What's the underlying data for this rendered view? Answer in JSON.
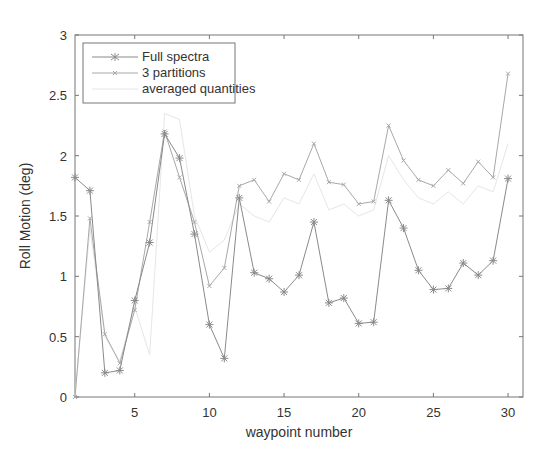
{
  "chart_data": {
    "type": "line",
    "title": "",
    "xlabel": "waypoint number",
    "ylabel": "Roll Motion (deg)",
    "xlim": [
      1,
      31
    ],
    "ylim": [
      0,
      3
    ],
    "xticks": [
      5,
      10,
      15,
      20,
      25,
      30
    ],
    "yticks": [
      0,
      0.5,
      1,
      1.5,
      2,
      2.5,
      3
    ],
    "grid": false,
    "legend_position": "upper left",
    "x": [
      1,
      2,
      3,
      4,
      5,
      6,
      7,
      8,
      9,
      10,
      11,
      12,
      13,
      14,
      15,
      16,
      17,
      18,
      19,
      20,
      21,
      22,
      23,
      24,
      25,
      26,
      27,
      28,
      29,
      30
    ],
    "series": [
      {
        "name": "Full spectra",
        "marker": "*",
        "color": "#8a8a8a",
        "values": [
          1.82,
          1.71,
          0.2,
          0.22,
          0.8,
          1.28,
          2.18,
          1.98,
          1.35,
          0.6,
          0.32,
          1.65,
          1.03,
          0.98,
          0.87,
          1.01,
          1.45,
          0.78,
          0.82,
          0.61,
          0.62,
          1.63,
          1.4,
          1.05,
          0.89,
          0.9,
          1.11,
          1.01,
          1.13,
          1.81
        ]
      },
      {
        "name": "3 partitions",
        "marker": "x",
        "color": "#a8a8a8",
        "values": [
          0.0,
          1.48,
          0.52,
          0.28,
          0.72,
          1.45,
          2.2,
          1.82,
          1.45,
          0.92,
          1.07,
          1.75,
          1.8,
          1.62,
          1.85,
          1.8,
          2.1,
          1.78,
          1.76,
          1.6,
          1.62,
          2.25,
          1.96,
          1.8,
          1.75,
          1.88,
          1.77,
          1.95,
          1.82,
          2.68
        ]
      },
      {
        "name": "averaged quantities",
        "marker": "none",
        "color": "#e6e6e6",
        "values": [
          0.0,
          1.4,
          0.5,
          0.3,
          0.75,
          0.35,
          2.35,
          2.3,
          1.5,
          1.2,
          1.3,
          1.6,
          1.5,
          1.45,
          1.65,
          1.6,
          1.85,
          1.55,
          1.6,
          1.5,
          1.55,
          2.0,
          1.8,
          1.65,
          1.6,
          1.7,
          1.6,
          1.75,
          1.7,
          2.1
        ]
      }
    ]
  }
}
